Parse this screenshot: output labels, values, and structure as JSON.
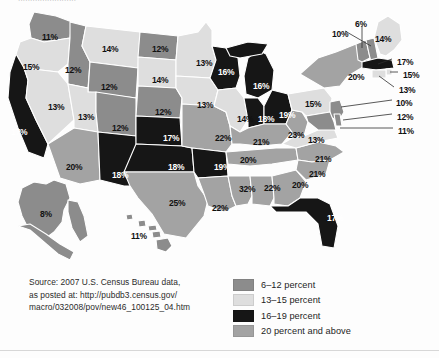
{
  "top_clipped_text": "........................",
  "source_note": {
    "lines": [
      "Source: 2007 U.S. Census Bureau data,",
      "as posted at: http://pubdb3.census.gov/",
      "macro/032008/pov/new46_100125_04.htm"
    ]
  },
  "legend": {
    "items": [
      {
        "label": "6–12 percent",
        "color": "#8c8c8c"
      },
      {
        "label": "13–15 percent",
        "color": "#dedede"
      },
      {
        "label": "16–19 percent",
        "color": "#161616"
      },
      {
        "label": "20 percent and above",
        "color": "#a3a3a3"
      }
    ]
  },
  "colors": {
    "bin_6_12": "#8c8c8c",
    "bin_13_15": "#dedede",
    "bin_16_19": "#161616",
    "bin_20_plus": "#a3a3a3",
    "border": "#ffffff",
    "outline": "#6e6e6e",
    "background": "#fdfdfd"
  },
  "chart_data": {
    "type": "map",
    "value_unit": "percent",
    "bins": [
      {
        "name": "6–12 percent",
        "min": 6,
        "max": 12,
        "color": "#8c8c8c"
      },
      {
        "name": "13–15 percent",
        "min": 13,
        "max": 15,
        "color": "#dedede"
      },
      {
        "name": "16–19 percent",
        "min": 16,
        "max": 19,
        "color": "#161616"
      },
      {
        "name": "20 percent and above",
        "min": 20,
        "max": 100,
        "color": "#a3a3a3"
      }
    ],
    "legend_position": "bottom-right",
    "source": "2007 U.S. Census Bureau data, as posted at: http://pubdb3.census.gov/macro/032008/pov/new46_100125_04.htm",
    "states": [
      {
        "code": "WA",
        "name": "Washington",
        "value": 11,
        "text": "11%",
        "bin": "6–12 percent",
        "x": 42,
        "y": 30,
        "dark": false,
        "leader": false
      },
      {
        "code": "OR",
        "name": "Oregon",
        "value": 15,
        "text": "15%",
        "bin": "13–15 percent",
        "x": 23,
        "y": 60,
        "dark": false,
        "leader": false
      },
      {
        "code": "ID",
        "name": "Idaho",
        "value": 12,
        "text": "12%",
        "bin": "6–12 percent",
        "x": 65,
        "y": 63,
        "dark": false,
        "leader": false
      },
      {
        "code": "MT",
        "name": "Montana",
        "value": 14,
        "text": "14%",
        "bin": "13–15 percent",
        "x": 102,
        "y": 42,
        "dark": false,
        "leader": false
      },
      {
        "code": "WY",
        "name": "Wyoming",
        "value": 12,
        "text": "12%",
        "bin": "6–12 percent",
        "x": 101,
        "y": 80,
        "dark": false,
        "leader": false
      },
      {
        "code": "ND",
        "name": "North Dakota",
        "value": 12,
        "text": "12%",
        "bin": "6–12 percent",
        "x": 152,
        "y": 42,
        "dark": false,
        "leader": false
      },
      {
        "code": "SD",
        "name": "South Dakota",
        "value": 14,
        "text": "14%",
        "bin": "13–15 percent",
        "x": 152,
        "y": 73,
        "dark": false,
        "leader": false
      },
      {
        "code": "NE",
        "name": "Nebraska",
        "value": 12,
        "text": "12%",
        "bin": "6–12 percent",
        "x": 155,
        "y": 105,
        "dark": false,
        "leader": false
      },
      {
        "code": "CA",
        "name": "California",
        "value": 17,
        "text": "17%",
        "bin": "16–19 percent",
        "x": 11,
        "y": 125,
        "dark": true,
        "leader": false
      },
      {
        "code": "NV",
        "name": "Nevada",
        "value": 13,
        "text": "13%",
        "bin": "13–15 percent",
        "x": 48,
        "y": 100,
        "dark": false,
        "leader": false
      },
      {
        "code": "UT",
        "name": "Utah",
        "value": 13,
        "text": "13%",
        "bin": "13–15 percent",
        "x": 78,
        "y": 110,
        "dark": false,
        "leader": false
      },
      {
        "code": "CO",
        "name": "Colorado",
        "value": 12,
        "text": "12%",
        "bin": "6–12 percent",
        "x": 112,
        "y": 121,
        "dark": false,
        "leader": false
      },
      {
        "code": "AZ",
        "name": "Arizona",
        "value": 20,
        "text": "20%",
        "bin": "20 percent and above",
        "x": 66,
        "y": 160,
        "dark": false,
        "leader": false
      },
      {
        "code": "NM",
        "name": "New Mexico",
        "value": 18,
        "text": "18%",
        "bin": "16–19 percent",
        "x": 112,
        "y": 168,
        "dark": true,
        "leader": false
      },
      {
        "code": "TX",
        "name": "Texas",
        "value": 25,
        "text": "25%",
        "bin": "20 percent and above",
        "x": 169,
        "y": 196,
        "dark": false,
        "leader": false
      },
      {
        "code": "OK",
        "name": "Oklahoma",
        "value": 18,
        "text": "18%",
        "bin": "16–19 percent",
        "x": 168,
        "y": 160,
        "dark": true,
        "leader": false
      },
      {
        "code": "KS",
        "name": "Kansas",
        "value": 17,
        "text": "17%",
        "bin": "16–19 percent",
        "x": 163,
        "y": 131,
        "dark": true,
        "leader": false
      },
      {
        "code": "MN",
        "name": "Minnesota",
        "value": 13,
        "text": "13%",
        "bin": "13–15 percent",
        "x": 196,
        "y": 56,
        "dark": false,
        "leader": false
      },
      {
        "code": "IA",
        "name": "Iowa",
        "value": 13,
        "text": "13%",
        "bin": "13–15 percent",
        "x": 197,
        "y": 98,
        "dark": false,
        "leader": false
      },
      {
        "code": "MO",
        "name": "Missouri",
        "value": 22,
        "text": "22%",
        "bin": "20 percent and above",
        "x": 215,
        "y": 131,
        "dark": false,
        "leader": false
      },
      {
        "code": "AR",
        "name": "Arkansas",
        "value": 19,
        "text": "19%",
        "bin": "16–19 percent",
        "x": 214,
        "y": 160,
        "dark": true,
        "leader": false
      },
      {
        "code": "LA",
        "name": "Louisiana",
        "value": 22,
        "text": "22%",
        "bin": "20 percent and above",
        "x": 212,
        "y": 201,
        "dark": false,
        "leader": false
      },
      {
        "code": "MS",
        "name": "Mississippi",
        "value": 32,
        "text": "32%",
        "bin": "20 percent and above",
        "x": 239,
        "y": 182,
        "dark": false,
        "leader": false
      },
      {
        "code": "AL",
        "name": "Alabama",
        "value": 22,
        "text": "22%",
        "bin": "20 percent and above",
        "x": 264,
        "y": 181,
        "dark": false,
        "leader": false
      },
      {
        "code": "GA",
        "name": "Georgia",
        "value": 20,
        "text": "20%",
        "bin": "20 percent and above",
        "x": 292,
        "y": 178,
        "dark": false,
        "leader": false
      },
      {
        "code": "FL",
        "name": "Florida",
        "value": 17,
        "text": "17%",
        "bin": "16–19 percent",
        "x": 327,
        "y": 211,
        "dark": true,
        "leader": false
      },
      {
        "code": "TN",
        "name": "Tennessee",
        "value": 20,
        "text": "20%",
        "bin": "20 percent and above",
        "x": 240,
        "y": 153,
        "dark": false,
        "leader": false
      },
      {
        "code": "KY",
        "name": "Kentucky",
        "value": 21,
        "text": "21%",
        "bin": "20 percent and above",
        "x": 253,
        "y": 135,
        "dark": false,
        "leader": false
      },
      {
        "code": "WI",
        "name": "Wisconsin",
        "value": 16,
        "text": "16%",
        "bin": "16–19 percent",
        "x": 218,
        "y": 65,
        "dark": true,
        "leader": false
      },
      {
        "code": "MI",
        "name": "Michigan",
        "value": 16,
        "text": "16%",
        "bin": "16–19 percent",
        "x": 253,
        "y": 79,
        "dark": true,
        "leader": false
      },
      {
        "code": "IL",
        "name": "Illinois",
        "value": 14,
        "text": "14%",
        "bin": "13–15 percent",
        "x": 237,
        "y": 112,
        "dark": false,
        "leader": false
      },
      {
        "code": "IN",
        "name": "Indiana",
        "value": 18,
        "text": "18%",
        "bin": "16–19 percent",
        "x": 258,
        "y": 112,
        "dark": true,
        "leader": false
      },
      {
        "code": "OH",
        "name": "Ohio",
        "value": 19,
        "text": "19%",
        "bin": "16–19 percent",
        "x": 279,
        "y": 108,
        "dark": true,
        "leader": false
      },
      {
        "code": "WV",
        "name": "West Virginia",
        "value": 23,
        "text": "23%",
        "bin": "20 percent and above",
        "x": 288,
        "y": 128,
        "dark": false,
        "leader": false
      },
      {
        "code": "VA",
        "name": "Virginia",
        "value": 13,
        "text": "13%",
        "bin": "13–15 percent",
        "x": 308,
        "y": 133,
        "dark": false,
        "leader": false
      },
      {
        "code": "NC",
        "name": "North Carolina",
        "value": 21,
        "text": "21%",
        "bin": "20 percent and above",
        "x": 315,
        "y": 152,
        "dark": false,
        "leader": false
      },
      {
        "code": "SC",
        "name": "South Carolina",
        "value": 21,
        "text": "21%",
        "bin": "20 percent and above",
        "x": 309,
        "y": 167,
        "dark": false,
        "leader": false
      },
      {
        "code": "PA",
        "name": "Pennsylvania",
        "value": 15,
        "text": "15%",
        "bin": "13–15 percent",
        "x": 305,
        "y": 97,
        "dark": false,
        "leader": false
      },
      {
        "code": "NY",
        "name": "New York",
        "value": 20,
        "text": "20%",
        "bin": "20 percent and above",
        "x": 348,
        "y": 70,
        "dark": false,
        "leader": false
      },
      {
        "code": "AK",
        "name": "Alaska",
        "value": 8,
        "text": "8%",
        "bin": "6–12 percent",
        "x": 40,
        "y": 207,
        "dark": false,
        "leader": false
      },
      {
        "code": "HI",
        "name": "Hawaii",
        "value": 11,
        "text": "11%",
        "bin": "6–12 percent",
        "x": 131,
        "y": 229,
        "dark": false,
        "leader": false
      },
      {
        "code": "VT",
        "name": "Vermont",
        "value": 6,
        "text": "6%",
        "bin": "6–12 percent",
        "x": 355,
        "y": 17,
        "dark": false,
        "leader": true
      },
      {
        "code": "ME",
        "name": "Maine",
        "value": 14,
        "text": "14%",
        "bin": "13–15 percent",
        "x": 375,
        "y": 32,
        "dark": false,
        "leader": false
      },
      {
        "code": "NH",
        "name": "New Hampshire",
        "value": 10,
        "text": "10%",
        "bin": "6–12 percent",
        "x": 332,
        "y": 27,
        "dark": false,
        "leader": true
      },
      {
        "code": "MA",
        "name": "Massachusetts",
        "value": 17,
        "text": "17%",
        "bin": "16–19 percent",
        "x": 397,
        "y": 55,
        "dark": false,
        "leader": true
      },
      {
        "code": "RI",
        "name": "Rhode Island",
        "value": 15,
        "text": "15%",
        "bin": "13–15 percent",
        "x": 403,
        "y": 68,
        "dark": false,
        "leader": true
      },
      {
        "code": "CT",
        "name": "Connecticut",
        "value": 13,
        "text": "13%",
        "bin": "13–15 percent",
        "x": 399,
        "y": 83,
        "dark": false,
        "leader": true
      },
      {
        "code": "NJ",
        "name": "New Jersey",
        "value": 10,
        "text": "10%",
        "bin": "6–12 percent",
        "x": 396,
        "y": 96,
        "dark": false,
        "leader": true
      },
      {
        "code": "DE",
        "name": "Delaware",
        "value": 12,
        "text": "12%",
        "bin": "6–12 percent",
        "x": 397,
        "y": 110,
        "dark": false,
        "leader": true
      },
      {
        "code": "MD",
        "name": "Maryland",
        "value": 11,
        "text": "11%",
        "bin": "6–12 percent",
        "x": 398,
        "y": 124,
        "dark": false,
        "leader": true
      }
    ]
  }
}
